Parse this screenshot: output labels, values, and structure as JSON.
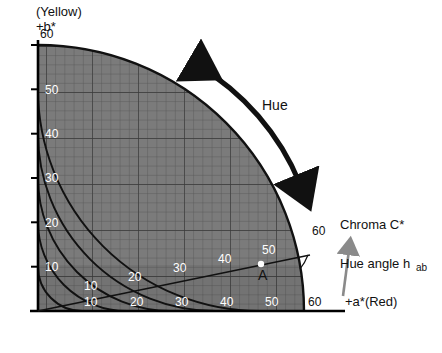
{
  "diagram": {
    "type": "cielab-chromaticity-quadrant",
    "title_top_left": "(Yellow)",
    "axis_y_label": "+b*",
    "axis_x_label": "+a*(Red)",
    "axis_max": 60,
    "y_ticks": [
      60,
      50,
      40,
      30,
      20,
      10
    ],
    "x_ticks_inner": [
      10,
      20,
      30,
      40,
      50
    ],
    "x_ticks_outer": [
      10,
      20,
      30,
      40,
      50,
      60
    ],
    "radial_tick_labels": [
      10,
      20,
      30,
      40,
      50
    ],
    "chroma_tick_label": "60",
    "point_label": "A",
    "annotations": {
      "hue": "Hue",
      "chroma": "Chroma C*",
      "hue_angle": "Hue angle h",
      "hue_angle_sub": "ab"
    },
    "colors": {
      "grid_fill": "#7b7b7b",
      "grid_line": "#4a4a4a",
      "arc_line": "#1a1a1a",
      "axis": "#000000",
      "annotation_gray": "#8a8a8a",
      "point": "#ffffff",
      "background": "#ffffff"
    }
  }
}
